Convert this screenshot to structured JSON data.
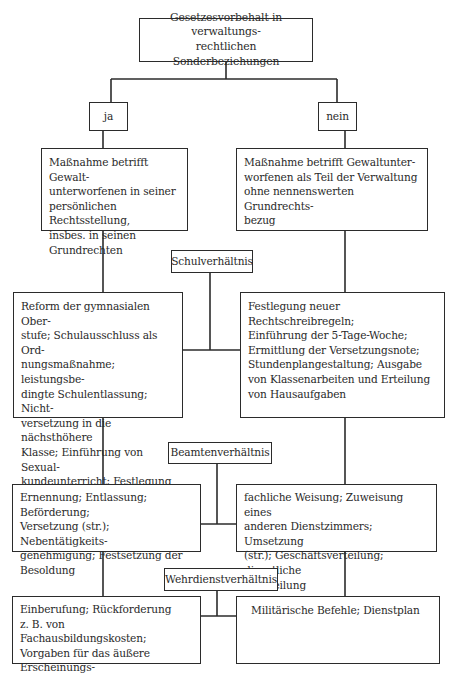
{
  "diagram": {
    "root": {
      "text": "Gesetzesvorbehalt in verwaltungs-\nrechtlichen Sonderbeziehungen"
    },
    "branches": {
      "yes": {
        "label": "ja"
      },
      "no": {
        "label": "nein"
      }
    },
    "criteria": {
      "yes": "Maßnahme betrifft Gewalt-\nunterworfenen in seiner\npersönlichen Rechtsstellung,\ninsbes. in seinen\nGrundrechten",
      "no": "Maßnahme betrifft Gewaltunter-\nworfenen als Teil der Verwaltung\nohne nennenswerten Grundrechts-\nbezug"
    },
    "relations": [
      {
        "name": "Schulverhältnis",
        "yes": "Reform der gymnasialen Ober-\nstufe; Schulausschluss als Ord-\nnungsmaßnahme; leistungsbe-\ndingte Schulentlassung; Nicht-\nversetzung in die nächsthöhere\nKlasse; Einführung von Sexual-\nkundeunterricht; Festlegung der\nPflichtfremdsprachen",
        "no": "Festlegung neuer Rechtschreibregeln;\nEinführung der 5-Tage-Woche;\nErmittlung der Versetzungsnote;\nStundenplangestaltung; Ausgabe\nvon Klassenarbeiten und Erteilung\nvon Hausaufgaben"
      },
      {
        "name": "Beamtenverhältnis",
        "yes": "Ernennung; Entlassung; Beförderung;\nVersetzung (str.); Nebentätigkeits-\ngenehmigung; Festsetzung der\nBesoldung",
        "no": "fachliche Weisung; Zuweisung eines\nanderen Dienstzimmers; Umsetzung\n(str.); Geschäftsverteilung; dienstliche\nBeurteilung"
      },
      {
        "name": "Wehrdienstverhältnis",
        "yes": "Einberufung; Rückforderung\nz. B. von Fachausbildungskosten;\nVorgaben für das äußere Erscheinungs-\nbild wie Haar- und Barttracht",
        "no": "Militärische Befehle; Dienstplan"
      }
    ],
    "colors": {
      "line": "#2b2b2b",
      "box_border": "#2b2b2b",
      "text": "#2a2a2a",
      "background": "#ffffff"
    }
  }
}
